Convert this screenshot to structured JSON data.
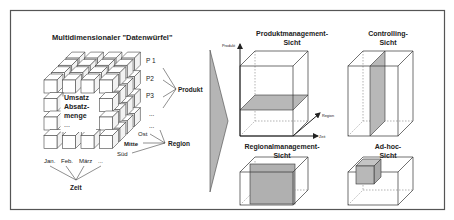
{
  "frame": {
    "border_color": "#555555",
    "background": "#ffffff"
  },
  "colors": {
    "slice_fill": "#b8b8b8",
    "line": "#333333",
    "arrow_fill": "#b5b5b5"
  },
  "left_panel": {
    "title": "Multidimensionaler \"Datenwürfel\"",
    "cube_face_text": [
      "Umsatz",
      "Absatz-",
      "menge",
      "..."
    ],
    "product_items": [
      "P 1",
      "P2",
      "P3",
      "..."
    ],
    "product_label": "Produkt",
    "region_items": [
      "Ost",
      "Mitte",
      "Süd"
    ],
    "region_extra": "...",
    "region_label": "Region",
    "time_items": [
      "Jan.",
      "Feb.",
      "März",
      "..."
    ],
    "time_label": "Zeit"
  },
  "views": {
    "produktmanagement": {
      "title_line1": "Produktmanagement-",
      "title_line2": "Sicht",
      "axis_y": "Produkt",
      "axis_depth": "Region",
      "axis_x": "Zeit"
    },
    "controlling": {
      "title_line1": "Controlling-",
      "title_line2": "Sicht"
    },
    "regionalmanagement": {
      "title_line1": "Regionalmanagement-",
      "title_line2": "Sicht"
    },
    "adhoc": {
      "title_line1": "Ad-hoc-",
      "title_line2": "Sicht"
    }
  }
}
